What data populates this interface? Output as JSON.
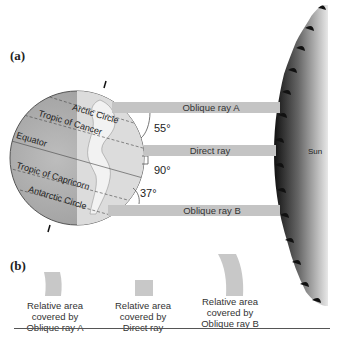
{
  "panels": {
    "a_label": "(a)",
    "b_label": "(b)"
  },
  "globe": {
    "lines": [
      {
        "name": "arctic-circle",
        "label": "Arctic Circle"
      },
      {
        "name": "tropic-of-cancer",
        "label": "Tropic of Cancer"
      },
      {
        "name": "equator",
        "label": "Equator"
      },
      {
        "name": "tropic-of-capricorn",
        "label": "Tropic of Capricorn"
      },
      {
        "name": "antarctic-circle",
        "label": "Antarctic Circle"
      }
    ]
  },
  "rays": [
    {
      "name": "oblique-ray-a",
      "label": "Oblique ray A",
      "angle": "55°"
    },
    {
      "name": "direct-ray",
      "label": "Direct ray",
      "angle": "90°"
    },
    {
      "name": "oblique-ray-b",
      "label": "Oblique ray B",
      "angle": "37°"
    }
  ],
  "sun": {
    "label": "Sun"
  },
  "areas": [
    {
      "line1": "Relative area",
      "line2": "covered by",
      "line3": "Oblique ray A"
    },
    {
      "line1": "Relative area",
      "line2": "covered by",
      "line3": "Direct ray"
    },
    {
      "line1": "Relative area",
      "line2": "covered by",
      "line3": "Oblique ray B"
    }
  ],
  "colors": {
    "ray": "#c4c4c4",
    "globe_dark": "#a9a9a9",
    "globe_light": "#d6d6d6",
    "sun_dark": "#1a1a1a"
  }
}
